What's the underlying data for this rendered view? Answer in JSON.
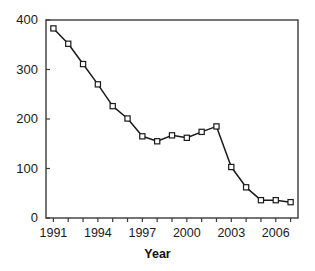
{
  "chart_data": {
    "type": "line",
    "title": "",
    "xlabel": "Year",
    "ylabel": "",
    "grid": false,
    "legend": "none",
    "marker": "open-square",
    "line_color": "#1a1a1a",
    "marker_fill": "#ffffff",
    "xlim": [
      1990.5,
      2007.5
    ],
    "ylim": [
      0,
      400
    ],
    "x": [
      1991,
      1992,
      1993,
      1994,
      1995,
      1996,
      1997,
      1998,
      1999,
      2000,
      2001,
      2002,
      2003,
      2004,
      2005,
      2006,
      2007
    ],
    "values": [
      383,
      352,
      311,
      270,
      226,
      201,
      165,
      155,
      167,
      162,
      174,
      185,
      103,
      62,
      36,
      36,
      32
    ],
    "xticks": [
      1991,
      1992,
      1993,
      1994,
      1995,
      1996,
      1997,
      1998,
      1999,
      2000,
      2001,
      2002,
      2003,
      2004,
      2005,
      2006,
      2007
    ],
    "xtick_labels_shown": [
      "1991",
      "1994",
      "1997",
      "2000",
      "2003",
      "2006"
    ],
    "xtick_label_values": [
      1991,
      1994,
      1997,
      2000,
      2003,
      2006
    ],
    "yticks": [
      0,
      100,
      200,
      300,
      400
    ],
    "ytick_labels": [
      "0",
      "100",
      "200",
      "300",
      "400"
    ]
  },
  "axes": {
    "x_title": "Year"
  }
}
